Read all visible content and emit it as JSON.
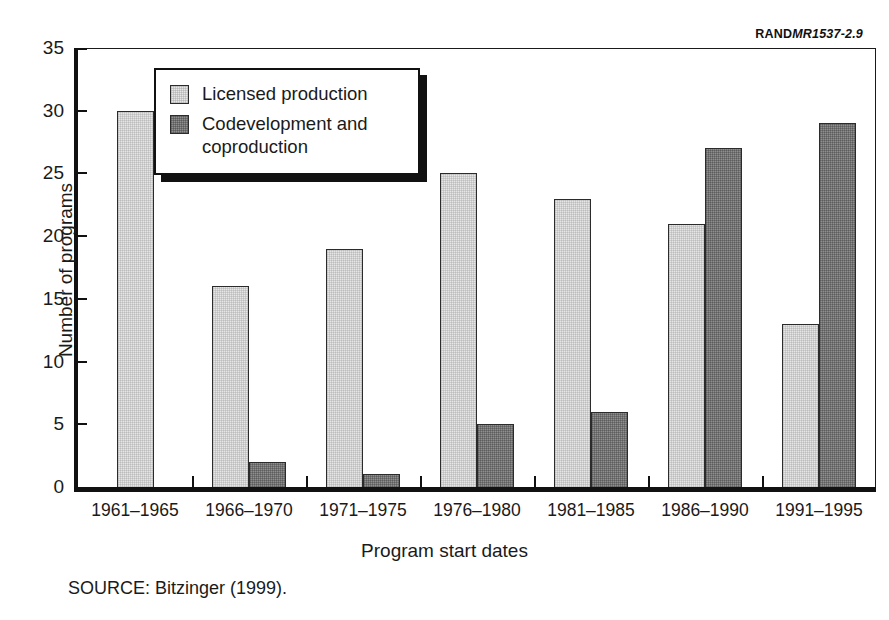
{
  "credit": {
    "brand": "RAND",
    "document_number": "MR1537-2.9"
  },
  "legend": {
    "position": "inside-top-left",
    "items": [
      {
        "label": "Licensed production",
        "color": "#e6e6e6",
        "key": "licensed"
      },
      {
        "label": "Codevelopment and coproduction",
        "color": "#8f8f8f",
        "key": "codev"
      }
    ]
  },
  "source_note": "SOURCE:  Bitzinger (1999).",
  "chart_data": {
    "type": "bar",
    "title": "",
    "xlabel": "Program start dates",
    "ylabel": "Number of programs",
    "categories": [
      "1961–1965",
      "1966–1970",
      "1971–1975",
      "1976–1980",
      "1981–1985",
      "1986–1990",
      "1991–1995"
    ],
    "series": [
      {
        "name": "Licensed production",
        "color": "#e6e6e6",
        "key": "licensed",
        "values": [
          30,
          16,
          19,
          25,
          23,
          21,
          13
        ]
      },
      {
        "name": "Codevelopment and coproduction",
        "color": "#8f8f8f",
        "key": "codev",
        "values": [
          0,
          2,
          1,
          5,
          6,
          27,
          29
        ]
      }
    ],
    "ylim": [
      0,
      35
    ],
    "yticks": [
      0,
      5,
      10,
      15,
      20,
      25,
      30,
      35
    ],
    "ytick_labels": [
      "0",
      "5",
      "10",
      "15",
      "20",
      "25",
      "30",
      "35"
    ],
    "grid": false,
    "legend_position": "upper left",
    "grouped": true
  }
}
